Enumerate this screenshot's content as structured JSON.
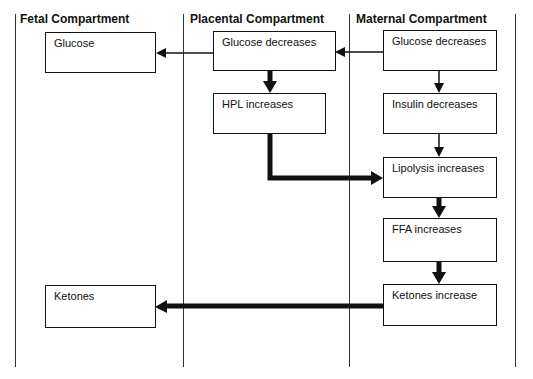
{
  "diagram": {
    "columns": [
      {
        "id": "fetal",
        "header": "Fetal Compartment"
      },
      {
        "id": "placental",
        "header": "Placental Compartment"
      },
      {
        "id": "maternal",
        "header": "Maternal Compartment"
      }
    ],
    "nodes": {
      "fetal_glucose": "Glucose",
      "placental_glucose": "Glucose decreases",
      "maternal_glucose": "Glucose decreases",
      "hpl": "HPL increases",
      "insulin": "Insulin decreases",
      "lipolysis": "Lipolysis increases",
      "ffa": "FFA increases",
      "maternal_ketones": "Ketones increase",
      "fetal_ketones": "Ketones"
    },
    "edges": [
      {
        "from": "maternal_glucose",
        "to": "placental_glucose",
        "weight": "thin"
      },
      {
        "from": "placental_glucose",
        "to": "fetal_glucose",
        "weight": "thin"
      },
      {
        "from": "placental_glucose",
        "to": "hpl",
        "weight": "thick"
      },
      {
        "from": "maternal_glucose",
        "to": "insulin",
        "weight": "thin"
      },
      {
        "from": "insulin",
        "to": "lipolysis",
        "weight": "thin"
      },
      {
        "from": "hpl",
        "to": "lipolysis",
        "weight": "thick"
      },
      {
        "from": "lipolysis",
        "to": "ffa",
        "weight": "thick"
      },
      {
        "from": "ffa",
        "to": "maternal_ketones",
        "weight": "thick"
      },
      {
        "from": "maternal_ketones",
        "to": "fetal_ketones",
        "weight": "thick"
      }
    ]
  }
}
